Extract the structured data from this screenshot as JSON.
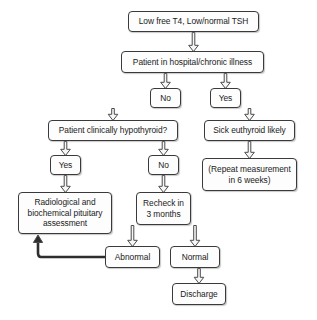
{
  "diagram": {
    "background_color": "#ffffff",
    "box_fill": "#fdfdfd",
    "box_border": "#3a3a3a",
    "arrow_color": "#4a4a4a",
    "nodes": [
      {
        "id": "low-free-t4",
        "label": "Low free T4, Low/normal TSH",
        "x": 128,
        "y": 11,
        "w": 131,
        "h": 21
      },
      {
        "id": "patient-in-hospital",
        "label": "Patient in hospital/chronic illness",
        "x": 121,
        "y": 51,
        "w": 143,
        "h": 22
      },
      {
        "id": "no-hospital",
        "label": "No",
        "x": 150,
        "y": 88,
        "w": 31,
        "h": 20
      },
      {
        "id": "yes-hospital",
        "label": "Yes",
        "x": 210,
        "y": 88,
        "w": 31,
        "h": 20
      },
      {
        "id": "clinically-hypothyroid",
        "label": "Patient clinically hypothyroid?",
        "x": 48,
        "y": 120,
        "w": 130,
        "h": 21
      },
      {
        "id": "sick-euthyroid",
        "label": "Sick euthyroid likely",
        "x": 204,
        "y": 120,
        "w": 91,
        "h": 21
      },
      {
        "id": "yes-hypothyroid",
        "label": "Yes",
        "x": 50,
        "y": 155,
        "w": 31,
        "h": 20
      },
      {
        "id": "no-hypothyroid",
        "label": "No",
        "x": 148,
        "y": 155,
        "w": 31,
        "h": 20
      },
      {
        "id": "repeat-measurement",
        "label": "(Repeat measurement\nin 6 weeks)",
        "x": 202,
        "y": 158,
        "w": 95,
        "h": 33
      },
      {
        "id": "pituitary-assessment",
        "label": "Radiological and\nbiochemical pituitary\nassessment",
        "x": 18,
        "y": 192,
        "w": 94,
        "h": 42
      },
      {
        "id": "recheck-3-months",
        "label": "Recheck in\n3 months",
        "x": 136,
        "y": 192,
        "w": 55,
        "h": 33
      },
      {
        "id": "abnormal",
        "label": "Abnormal",
        "x": 105,
        "y": 246,
        "w": 55,
        "h": 22
      },
      {
        "id": "normal",
        "label": "Normal",
        "x": 170,
        "y": 246,
        "w": 50,
        "h": 22
      },
      {
        "id": "discharge",
        "label": "Discharge",
        "x": 172,
        "y": 283,
        "w": 54,
        "h": 22
      }
    ],
    "edges": [
      {
        "id": "e-t4-to-hospital",
        "from": "low-free-t4",
        "to": "patient-in-hospital",
        "style": "hollow-down"
      },
      {
        "id": "e-hospital-to-no",
        "from": "patient-in-hospital",
        "to": "no-hospital",
        "style": "hollow-down"
      },
      {
        "id": "e-hospital-to-yes",
        "from": "patient-in-hospital",
        "to": "yes-hospital",
        "style": "hollow-down"
      },
      {
        "id": "e-no-to-hypothyroid",
        "from": "no-hospital",
        "to": "clinically-hypothyroid",
        "style": "hollow-down"
      },
      {
        "id": "e-yes-to-sick",
        "from": "yes-hospital",
        "to": "sick-euthyroid",
        "style": "hollow-down"
      },
      {
        "id": "e-hypothyroid-to-yes",
        "from": "clinically-hypothyroid",
        "to": "yes-hypothyroid",
        "style": "hollow-down"
      },
      {
        "id": "e-hypothyroid-to-no",
        "from": "clinically-hypothyroid",
        "to": "no-hypothyroid",
        "style": "hollow-down"
      },
      {
        "id": "e-sick-to-repeat",
        "from": "sick-euthyroid",
        "to": "repeat-measurement",
        "style": "hollow-down"
      },
      {
        "id": "e-yes-to-pituitary",
        "from": "yes-hypothyroid",
        "to": "pituitary-assessment",
        "style": "hollow-down"
      },
      {
        "id": "e-no-to-recheck",
        "from": "no-hypothyroid",
        "to": "recheck-3-months",
        "style": "hollow-down"
      },
      {
        "id": "e-recheck-to-abnormal",
        "from": "recheck-3-months",
        "to": "abnormal",
        "style": "hollow-down"
      },
      {
        "id": "e-recheck-to-normal",
        "from": "recheck-3-months",
        "to": "normal",
        "style": "hollow-down"
      },
      {
        "id": "e-normal-to-discharge",
        "from": "normal",
        "to": "discharge",
        "style": "hollow-down"
      },
      {
        "id": "e-abnormal-to-pituitary",
        "from": "abnormal",
        "to": "pituitary-assessment",
        "style": "solid-feedback-loop"
      }
    ]
  }
}
